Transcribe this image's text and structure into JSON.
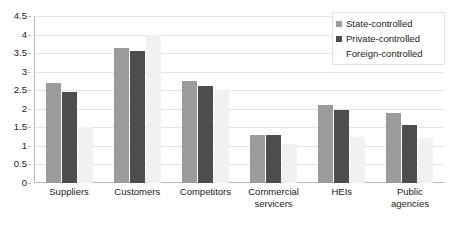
{
  "chart_data": {
    "type": "bar",
    "title": "",
    "xlabel": "",
    "ylabel": "",
    "ylim": [
      0,
      4.5
    ],
    "yticks": [
      "0",
      "0.5",
      "1",
      "1.5",
      "2",
      "2.5",
      "3",
      "3.5",
      "4",
      "4.5"
    ],
    "ytick_values": [
      0,
      0.5,
      1,
      1.5,
      2,
      2.5,
      3,
      3.5,
      4,
      4.5
    ],
    "grid": true,
    "legend_position": "top-right",
    "categories": [
      "Suppliers",
      "Customers",
      "Competitors",
      "Commercial servicers",
      "HEIs",
      "Public agencies"
    ],
    "category_lines": [
      [
        "Suppliers"
      ],
      [
        "Customers"
      ],
      [
        "Competitors"
      ],
      [
        "Commercial",
        "servicers"
      ],
      [
        "HEIs"
      ],
      [
        "Public",
        "agencies"
      ]
    ],
    "series": [
      {
        "name": "State-controlled",
        "color": "#9b9b9b",
        "values": [
          2.7,
          3.65,
          2.75,
          1.3,
          2.1,
          1.9
        ]
      },
      {
        "name": "Private-controlled",
        "color": "#4d4d4d",
        "values": [
          2.45,
          3.57,
          2.62,
          1.3,
          1.97,
          1.55
        ]
      },
      {
        "name": "Foreign-controlled",
        "color": "#f1f1f1",
        "values": [
          1.5,
          4.0,
          2.5,
          1.05,
          1.25,
          1.2
        ]
      }
    ]
  },
  "legend": {
    "items": [
      {
        "label": "State-controlled",
        "swatch": "state"
      },
      {
        "label": "Private-controlled",
        "swatch": "private"
      },
      {
        "label": "Foreign-controlled",
        "swatch": "foreign"
      }
    ]
  },
  "colors": {
    "state": "#9b9b9b",
    "private": "#4d4d4d",
    "foreign": "#f1f1f1",
    "grid": "#e4e4e4",
    "axis": "#b9b9b9",
    "text": "#1b1b1b"
  }
}
